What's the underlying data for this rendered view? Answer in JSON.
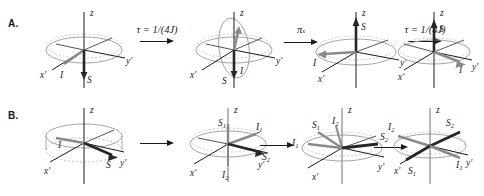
{
  "figure": {
    "background": "#ffffff",
    "ink": "#1a1a1a",
    "gray_vector": "#8a8a8a",
    "dark_vector": "#262626",
    "ellipse_stroke": "#9a9a9a"
  },
  "panels": [
    {
      "id": "A",
      "label": "A.",
      "arrows": [
        {
          "label_tau": "τ = 1/(4J)",
          "label_pi": ""
        },
        {
          "label_tau": "",
          "label_pi": "π"
        },
        {
          "label_tau": "τ = 1/(4J)",
          "label_pi": ""
        }
      ],
      "arrow_labels": [
        "τ = 1/(4J)",
        "π",
        "τ = 1/(4J)"
      ],
      "arrow_pi_subscript": "x",
      "states": [
        {
          "name": "state-a1",
          "axes": {
            "z": "z",
            "yprime": "y'",
            "xprime": "x'"
          },
          "vectors": [
            {
              "name": "I",
              "label": "I",
              "color": "gray"
            },
            {
              "name": "S",
              "label": "S",
              "color": "dark"
            }
          ]
        },
        {
          "name": "state-a2",
          "axes": {
            "z": "z",
            "yprime": "y'",
            "xprime": "x'"
          },
          "vectors": [
            {
              "name": "I",
              "label": "I",
              "color": "gray"
            },
            {
              "name": "S",
              "label": "S",
              "color": "dark"
            }
          ]
        },
        {
          "name": "state-a3",
          "axes": {
            "z": "z",
            "yprime": "y'",
            "xprime": "x'"
          },
          "vectors": [
            {
              "name": "S",
              "label": "S",
              "color": "dark"
            },
            {
              "name": "I",
              "label": "I",
              "color": "gray"
            }
          ]
        },
        {
          "name": "state-a4",
          "axes": {
            "z": "z",
            "yprime": "y'",
            "xprime": "x'"
          },
          "vectors": [
            {
              "name": "S",
              "label": "S",
              "color": "dark"
            },
            {
              "name": "I",
              "label": "I",
              "color": "gray"
            }
          ]
        }
      ]
    },
    {
      "id": "B",
      "label": "B.",
      "arrows": [
        {
          "label": ""
        },
        {
          "label": ""
        },
        {
          "label": ""
        }
      ],
      "states": [
        {
          "name": "state-b1",
          "axes": {
            "z": "z",
            "yprime": "y'",
            "xprime": "x'"
          },
          "vectors": [
            {
              "name": "I",
              "label": "I",
              "sub": "",
              "color": "gray"
            },
            {
              "name": "S",
              "label": "S",
              "sub": "",
              "color": "dark"
            }
          ]
        },
        {
          "name": "state-b2",
          "axes": {
            "z": "z",
            "yprime": "y'",
            "xprime": "x'"
          },
          "vectors": [
            {
              "name": "S1",
              "label": "S",
              "sub": "1",
              "color": "gray"
            },
            {
              "name": "I1",
              "label": "I",
              "sub": "1",
              "color": "gray"
            },
            {
              "name": "S2",
              "label": "S",
              "sub": "2",
              "color": "dark"
            },
            {
              "name": "I2",
              "label": "I",
              "sub": "2",
              "color": "dark"
            }
          ]
        },
        {
          "name": "state-b3",
          "axes": {
            "z": "z",
            "yprime": "y'",
            "xprime": "x'"
          },
          "vectors": [
            {
              "name": "S1",
              "label": "S",
              "sub": "1",
              "color": "gray"
            },
            {
              "name": "I2",
              "label": "I",
              "sub": "2",
              "color": "dark"
            },
            {
              "name": "I1",
              "label": "I",
              "sub": "1",
              "color": "gray"
            },
            {
              "name": "S2",
              "label": "S",
              "sub": "2",
              "color": "dark"
            }
          ]
        },
        {
          "name": "state-b4",
          "axes": {
            "z": "z",
            "yprime": "y'",
            "xprime": "x'"
          },
          "vectors": [
            {
              "name": "I2",
              "label": "I",
              "sub": "2",
              "color": "gray"
            },
            {
              "name": "S2",
              "label": "S",
              "sub": "2",
              "color": "dark"
            },
            {
              "name": "S1",
              "label": "S",
              "sub": "1",
              "color": "dark"
            },
            {
              "name": "I1",
              "label": "I",
              "sub": "1",
              "color": "gray"
            }
          ]
        }
      ]
    }
  ]
}
